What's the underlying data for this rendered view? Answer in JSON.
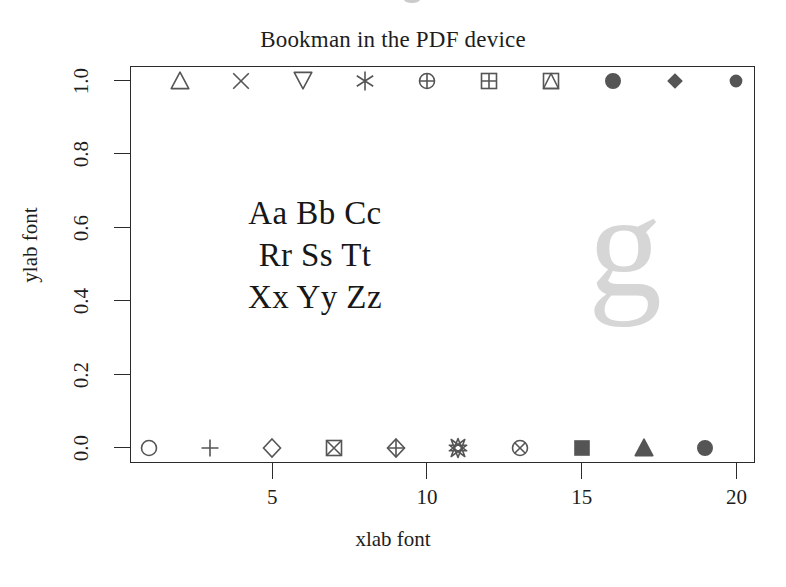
{
  "figure": {
    "title": "Bookman in the PDF device",
    "xlab": "xlab font",
    "ylab": "ylab font",
    "sample_lines": [
      "Aa Bb Cc",
      "Rr Ss Tt",
      "Xx Yy Zz"
    ],
    "big_glyph": "g",
    "marker_color": "#555555",
    "axis_color": "#2b2b2b",
    "glyph_color": "#d6d6d6",
    "background": "#ffffff"
  },
  "chart_data": {
    "type": "scatter",
    "title": "Bookman in the PDF device",
    "xlabel": "xlab font",
    "ylabel": "ylab font",
    "xlim": [
      0.4,
      20.6
    ],
    "ylim": [
      -0.04,
      1.04
    ],
    "grid": false,
    "legend": null,
    "xticks": [
      "5",
      "10",
      "15",
      "20"
    ],
    "xtick_values": [
      5,
      10,
      15,
      20
    ],
    "yticks": [
      "0.0",
      "0.2",
      "0.4",
      "0.6",
      "0.8",
      "1.0"
    ],
    "ytick_values": [
      0.0,
      0.2,
      0.4,
      0.6,
      0.8,
      1.0
    ],
    "annotations": [
      {
        "text": "Aa Bb Cc",
        "x": 5.5,
        "y": 0.62
      },
      {
        "text": "Rr Ss Tt",
        "x": 5.5,
        "y": 0.5
      },
      {
        "text": "Xx Yy Zz",
        "x": 5.5,
        "y": 0.38
      },
      {
        "text": "g",
        "x": 16.0,
        "y": 0.5
      }
    ],
    "series": [
      {
        "name": "odd pch (bottom row, y = 0)",
        "x": [
          1,
          3,
          5,
          7,
          9,
          11,
          13,
          15,
          17,
          19
        ],
        "y": [
          0,
          0,
          0,
          0,
          0,
          0,
          0,
          0,
          0,
          0
        ],
        "pch": [
          1,
          3,
          5,
          7,
          9,
          11,
          13,
          15,
          17,
          19
        ],
        "symbols": [
          "circle",
          "plus",
          "diamond",
          "square-cross",
          "diamond-plus",
          "hexagram-star",
          "circle-cross",
          "filled-square",
          "filled-triangle-up",
          "filled-circle"
        ]
      },
      {
        "name": "even pch (top row, y = 1)",
        "x": [
          2,
          4,
          6,
          8,
          10,
          12,
          14,
          16,
          18,
          20
        ],
        "y": [
          1,
          1,
          1,
          1,
          1,
          1,
          1,
          1,
          1,
          1
        ],
        "pch": [
          2,
          4,
          6,
          8,
          10,
          12,
          14,
          16,
          18,
          20
        ],
        "symbols": [
          "triangle-up",
          "cross-x",
          "triangle-down",
          "asterisk",
          "circle-plus",
          "square-plus",
          "square-triangle",
          "filled-circle",
          "filled-diamond",
          "small-filled-circle"
        ]
      }
    ]
  }
}
